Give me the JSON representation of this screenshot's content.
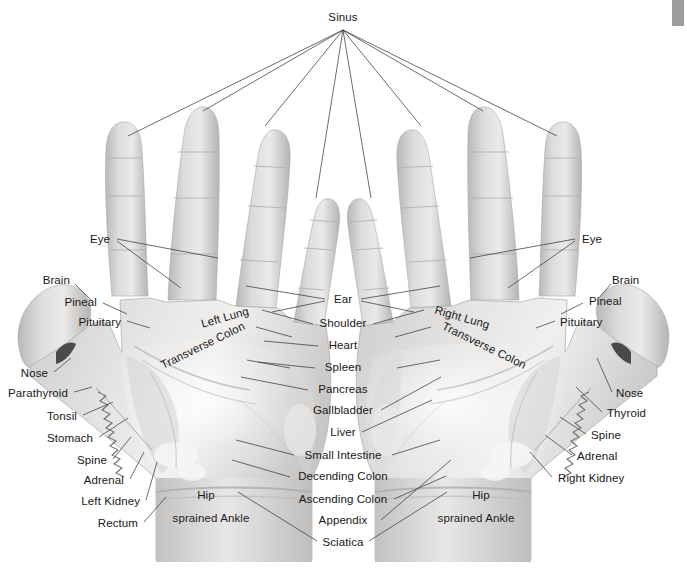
{
  "chart": {
    "background_color": "#ffffff",
    "text_color": "#17171a",
    "leader_line_color": "#3b3b3b",
    "width": 687,
    "height": 569
  },
  "top_label": {
    "text": "Sinus",
    "x": 343,
    "y": 18
  },
  "corner_artifact": {
    "color": "#9d9d9d",
    "x": 672,
    "y": 0,
    "width": 12,
    "height": 26
  },
  "labels_left": [
    {
      "text": "Eye",
      "x": 110,
      "y": 240
    },
    {
      "text": "Brain",
      "x": 70,
      "y": 281
    },
    {
      "text": "Pineal",
      "x": 97,
      "y": 303
    },
    {
      "text": "Pituitary",
      "x": 121,
      "y": 323
    },
    {
      "text": "Nose",
      "x": 48,
      "y": 374
    },
    {
      "text": "Parathyroid",
      "x": 68,
      "y": 394
    },
    {
      "text": "Tonsil",
      "x": 77,
      "y": 417
    },
    {
      "text": "Stomach",
      "x": 93,
      "y": 439
    },
    {
      "text": "Spine",
      "x": 107,
      "y": 461
    },
    {
      "text": "Adrenal",
      "x": 124,
      "y": 481
    },
    {
      "text": "Left Kidney",
      "x": 140,
      "y": 502
    },
    {
      "text": "Rectum",
      "x": 138,
      "y": 524
    }
  ],
  "labels_right": [
    {
      "text": "Eye",
      "x": 582,
      "y": 240
    },
    {
      "text": "Brain",
      "x": 612,
      "y": 281
    },
    {
      "text": "Pineal",
      "x": 589,
      "y": 302
    },
    {
      "text": "Pituitary",
      "x": 560,
      "y": 323
    },
    {
      "text": "Nose",
      "x": 616,
      "y": 394
    },
    {
      "text": "Thyroid",
      "x": 607,
      "y": 414
    },
    {
      "text": "Spine",
      "x": 591,
      "y": 436
    },
    {
      "text": "Adrenal",
      "x": 577,
      "y": 457
    },
    {
      "text": "Right Kidney",
      "x": 558,
      "y": 479
    }
  ],
  "labels_center": [
    {
      "text": "Ear",
      "x": 343,
      "y": 300
    },
    {
      "text": "Shoulder",
      "x": 343,
      "y": 324
    },
    {
      "text": "Heart",
      "x": 343,
      "y": 346
    },
    {
      "text": "Spleen",
      "x": 343,
      "y": 368
    },
    {
      "text": "Pancreas",
      "x": 343,
      "y": 390
    },
    {
      "text": "Gallbladder",
      "x": 343,
      "y": 411
    },
    {
      "text": "Liver",
      "x": 343,
      "y": 433
    },
    {
      "text": "Small Intestine",
      "x": 343,
      "y": 456
    },
    {
      "text": "Decending Colon",
      "x": 343,
      "y": 477
    },
    {
      "text": "Ascending Colon",
      "x": 343,
      "y": 500
    },
    {
      "text": "Appendix",
      "x": 343,
      "y": 521
    },
    {
      "text": "Sciatica",
      "x": 343,
      "y": 543
    }
  ],
  "labels_on_hand": [
    {
      "text": "Left Lung",
      "x": 225,
      "y": 318,
      "rotate": -16
    },
    {
      "text": "Transverse Colon",
      "x": 203,
      "y": 346,
      "rotate": -26
    },
    {
      "text": "Hip",
      "x": 206,
      "y": 496,
      "rotate": 0
    },
    {
      "text": "sprained Ankle",
      "x": 211,
      "y": 519,
      "rotate": 0
    },
    {
      "text": "Right Lung",
      "x": 462,
      "y": 318,
      "rotate": 16
    },
    {
      "text": "Transverse Colon",
      "x": 484,
      "y": 346,
      "rotate": 26
    },
    {
      "text": "Hip",
      "x": 481,
      "y": 496,
      "rotate": 0
    },
    {
      "text": "sprained Ankle",
      "x": 476,
      "y": 519,
      "rotate": 0
    }
  ],
  "sinus_leader_targets": [
    {
      "x": 128,
      "y": 136
    },
    {
      "x": 203,
      "y": 111
    },
    {
      "x": 265,
      "y": 126
    },
    {
      "x": 316,
      "y": 198
    },
    {
      "x": 371,
      "y": 198
    },
    {
      "x": 421,
      "y": 126
    },
    {
      "x": 483,
      "y": 111
    },
    {
      "x": 557,
      "y": 136
    }
  ],
  "leader_lines": [
    {
      "name": "eye-left-a",
      "x1": 117,
      "y1": 239,
      "x2": 218,
      "y2": 258
    },
    {
      "name": "eye-left-b",
      "x1": 117,
      "y1": 241,
      "x2": 181,
      "y2": 288
    },
    {
      "name": "brain-left",
      "x1": 75,
      "y1": 284,
      "x2": 91,
      "y2": 300
    },
    {
      "name": "pineal-left",
      "x1": 103,
      "y1": 303,
      "x2": 127,
      "y2": 314
    },
    {
      "name": "pituitary-left",
      "x1": 127,
      "y1": 321,
      "x2": 150,
      "y2": 328
    },
    {
      "name": "nose-left",
      "x1": 54,
      "y1": 372,
      "x2": 71,
      "y2": 358
    },
    {
      "name": "parathyroid-left",
      "x1": 74,
      "y1": 392,
      "x2": 92,
      "y2": 387
    },
    {
      "name": "tonsil-left",
      "x1": 83,
      "y1": 415,
      "x2": 113,
      "y2": 402
    },
    {
      "name": "stomach-left",
      "x1": 99,
      "y1": 437,
      "x2": 128,
      "y2": 418
    },
    {
      "name": "spine-left",
      "x1": 113,
      "y1": 459,
      "x2": 131,
      "y2": 437
    },
    {
      "name": "adrenal-left",
      "x1": 130,
      "y1": 479,
      "x2": 144,
      "y2": 452
    },
    {
      "name": "leftkidney-left",
      "x1": 146,
      "y1": 500,
      "x2": 157,
      "y2": 462
    },
    {
      "name": "rectum-left",
      "x1": 144,
      "y1": 522,
      "x2": 166,
      "y2": 497
    },
    {
      "name": "eye-right-a",
      "x1": 575,
      "y1": 239,
      "x2": 470,
      "y2": 258
    },
    {
      "name": "eye-right-b",
      "x1": 575,
      "y1": 241,
      "x2": 508,
      "y2": 288
    },
    {
      "name": "brain-right",
      "x1": 611,
      "y1": 284,
      "x2": 597,
      "y2": 300
    },
    {
      "name": "pineal-right",
      "x1": 583,
      "y1": 303,
      "x2": 561,
      "y2": 314
    },
    {
      "name": "pituitary-right",
      "x1": 555,
      "y1": 321,
      "x2": 536,
      "y2": 328
    },
    {
      "name": "nose-right",
      "x1": 612,
      "y1": 392,
      "x2": 597,
      "y2": 358
    },
    {
      "name": "thyroid-right",
      "x1": 602,
      "y1": 412,
      "x2": 576,
      "y2": 387
    },
    {
      "name": "spine-right",
      "x1": 586,
      "y1": 434,
      "x2": 560,
      "y2": 417
    },
    {
      "name": "adrenal-right",
      "x1": 572,
      "y1": 455,
      "x2": 545,
      "y2": 435
    },
    {
      "name": "rightkidney-right",
      "x1": 552,
      "y1": 477,
      "x2": 530,
      "y2": 452
    },
    {
      "name": "ear-left",
      "x1": 325,
      "y1": 299,
      "x2": 246,
      "y2": 286
    },
    {
      "name": "ear-left2",
      "x1": 325,
      "y1": 301,
      "x2": 272,
      "y2": 312
    },
    {
      "name": "ear-right",
      "x1": 361,
      "y1": 299,
      "x2": 440,
      "y2": 286
    },
    {
      "name": "ear-right2",
      "x1": 361,
      "y1": 301,
      "x2": 414,
      "y2": 312
    },
    {
      "name": "shoulder-left",
      "x1": 313,
      "y1": 324,
      "x2": 262,
      "y2": 310
    },
    {
      "name": "shoulder-right",
      "x1": 373,
      "y1": 324,
      "x2": 424,
      "y2": 310
    },
    {
      "name": "heart-left",
      "x1": 318,
      "y1": 346,
      "x2": 264,
      "y2": 341
    },
    {
      "name": "spleen-left",
      "x1": 315,
      "y1": 368,
      "x2": 258,
      "y2": 362
    },
    {
      "name": "pancreas-left",
      "x1": 308,
      "y1": 390,
      "x2": 241,
      "y2": 377
    },
    {
      "name": "gallbladder-right",
      "x1": 381,
      "y1": 410,
      "x2": 441,
      "y2": 377
    },
    {
      "name": "liver-right",
      "x1": 362,
      "y1": 432,
      "x2": 432,
      "y2": 400
    },
    {
      "name": "smallint-right",
      "x1": 392,
      "y1": 455,
      "x2": 440,
      "y2": 440
    },
    {
      "name": "smallint-left",
      "x1": 294,
      "y1": 455,
      "x2": 236,
      "y2": 440
    },
    {
      "name": "decending-left",
      "x1": 290,
      "y1": 477,
      "x2": 232,
      "y2": 460
    },
    {
      "name": "ascending-right",
      "x1": 394,
      "y1": 499,
      "x2": 446,
      "y2": 476
    },
    {
      "name": "appendix-right",
      "x1": 381,
      "y1": 520,
      "x2": 451,
      "y2": 460
    },
    {
      "name": "sciatica-left",
      "x1": 317,
      "y1": 541,
      "x2": 238,
      "y2": 492
    },
    {
      "name": "sciatica-right",
      "x1": 369,
      "y1": 541,
      "x2": 447,
      "y2": 492
    },
    {
      "name": "leftlung-leader",
      "x1": 256,
      "y1": 327,
      "x2": 292,
      "y2": 337
    },
    {
      "name": "transcolon-left-leader",
      "x1": 247,
      "y1": 360,
      "x2": 290,
      "y2": 368
    },
    {
      "name": "rightlung-leader",
      "x1": 431,
      "y1": 327,
      "x2": 395,
      "y2": 337
    },
    {
      "name": "transcolon-right-leader",
      "x1": 440,
      "y1": 360,
      "x2": 397,
      "y2": 368
    }
  ]
}
